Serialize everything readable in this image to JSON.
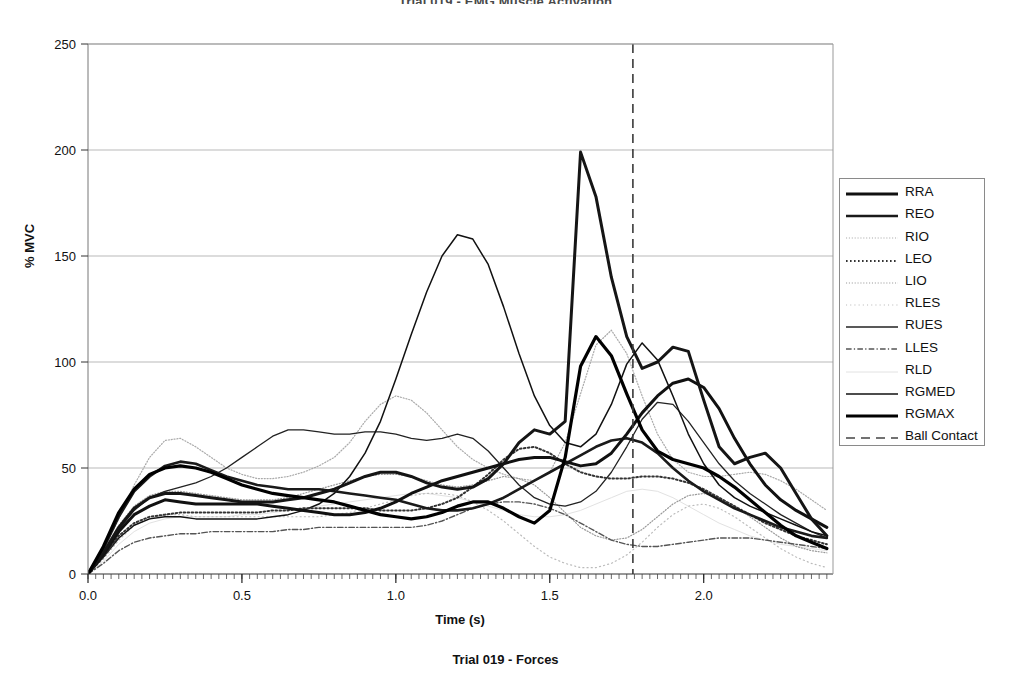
{
  "top_title": "Trial 019 - EMG Muscle Activation",
  "bottom_caption": "Trial 019 - Forces",
  "axes": {
    "ylabel": "% MVC",
    "xlabel": "Time (s)",
    "ytick_labels": [
      "0",
      "50",
      "100",
      "150",
      "200",
      "250"
    ],
    "xtick_labels": [
      "0.0",
      "0.5",
      "1.0",
      "1.5",
      "2.0"
    ]
  },
  "legend": {
    "items": [
      {
        "label": "RRA",
        "style": "thick-solid",
        "color": "#111111",
        "width": 3.0
      },
      {
        "label": "REO",
        "style": "thick-solid",
        "color": "#1a1a1a",
        "width": 2.6
      },
      {
        "label": "RIO",
        "style": "fine-dotted",
        "color": "#aaaaaa",
        "width": 1.2
      },
      {
        "label": "LEO",
        "style": "dotted-dark",
        "color": "#333333",
        "width": 2.0
      },
      {
        "label": "LIO",
        "style": "fine-dotted",
        "color": "#999999",
        "width": 1.2
      },
      {
        "label": "RLES",
        "style": "sparse-dotted",
        "color": "#bbbbbb",
        "width": 1.2
      },
      {
        "label": "RUES",
        "style": "thin-solid",
        "color": "#222222",
        "width": 1.3
      },
      {
        "label": "LLES",
        "style": "dash-dot",
        "color": "#555555",
        "width": 1.4
      },
      {
        "label": "RLD",
        "style": "faint",
        "color": "#e2e2e2",
        "width": 1.0
      },
      {
        "label": "RGMED",
        "style": "thin-solid",
        "color": "#111111",
        "width": 1.5
      },
      {
        "label": "RGMAX",
        "style": "thick-solid",
        "color": "#000000",
        "width": 3.2
      },
      {
        "label": "Ball Contact",
        "style": "dashed",
        "color": "#444444",
        "width": 1.6
      }
    ]
  },
  "chart_data": {
    "type": "line",
    "title": "Trial 019 - EMG Muscle Activation",
    "xlabel": "Time (s)",
    "ylabel": "% MVC",
    "xlim": [
      0.0,
      2.42
    ],
    "ylim": [
      0,
      250
    ],
    "xticks": [
      0.0,
      0.5,
      1.0,
      1.5,
      2.0
    ],
    "yticks": [
      0,
      50,
      100,
      150,
      200,
      250
    ],
    "grid": "horizontal",
    "legend_position": "right-outside",
    "annotations": [
      {
        "type": "vline",
        "name": "Ball Contact",
        "x": 1.77,
        "style": "dashed"
      }
    ],
    "x": [
      0.0,
      0.05,
      0.1,
      0.15,
      0.2,
      0.25,
      0.3,
      0.35,
      0.4,
      0.45,
      0.5,
      0.55,
      0.6,
      0.65,
      0.7,
      0.75,
      0.8,
      0.85,
      0.9,
      0.95,
      1.0,
      1.05,
      1.1,
      1.15,
      1.2,
      1.25,
      1.3,
      1.35,
      1.4,
      1.45,
      1.5,
      1.55,
      1.6,
      1.65,
      1.7,
      1.75,
      1.8,
      1.85,
      1.9,
      1.95,
      2.0,
      2.05,
      2.1,
      2.15,
      2.2,
      2.25,
      2.3,
      2.35,
      2.4
    ],
    "series": [
      {
        "name": "RRA",
        "color": "#111111",
        "style": "thick-solid",
        "values": [
          0,
          9,
          20,
          28,
          32,
          35,
          34,
          33,
          33,
          33,
          33,
          33,
          32,
          31,
          30,
          29,
          28,
          28,
          29,
          31,
          34,
          38,
          41,
          44,
          46,
          48,
          50,
          52,
          54,
          55,
          55,
          53,
          51,
          52,
          57,
          66,
          76,
          84,
          90,
          92,
          88,
          78,
          64,
          52,
          42,
          35,
          30,
          26,
          22
        ]
      },
      {
        "name": "REO",
        "color": "#1a1a1a",
        "style": "thick-solid",
        "values": [
          0,
          12,
          27,
          39,
          46,
          51,
          53,
          52,
          49,
          46,
          44,
          42,
          41,
          40,
          40,
          40,
          39,
          38,
          37,
          36,
          35,
          33,
          31,
          30,
          30,
          31,
          33,
          36,
          40,
          44,
          48,
          52,
          56,
          60,
          63,
          64,
          62,
          57,
          50,
          44,
          39,
          35,
          31,
          28,
          25,
          22,
          20,
          18,
          17
        ]
      },
      {
        "name": "RIO",
        "color": "#aaaaaa",
        "style": "fine-dotted",
        "values": [
          0,
          11,
          26,
          42,
          55,
          63,
          64,
          60,
          55,
          50,
          47,
          45,
          45,
          46,
          48,
          51,
          55,
          62,
          72,
          80,
          84,
          82,
          76,
          68,
          60,
          54,
          50,
          47,
          45,
          44,
          48,
          62,
          85,
          108,
          115,
          104,
          84,
          66,
          54,
          48,
          46,
          46,
          47,
          48,
          47,
          44,
          40,
          35,
          30
        ]
      },
      {
        "name": "LEO",
        "color": "#333333",
        "style": "dotted-dark",
        "values": [
          0,
          8,
          18,
          24,
          27,
          28,
          29,
          29,
          29,
          29,
          29,
          29,
          30,
          30,
          31,
          31,
          31,
          31,
          31,
          30,
          30,
          30,
          31,
          33,
          36,
          41,
          47,
          54,
          59,
          60,
          57,
          52,
          48,
          46,
          45,
          45,
          46,
          46,
          45,
          43,
          40,
          36,
          32,
          28,
          24,
          21,
          18,
          16,
          14
        ]
      },
      {
        "name": "LIO",
        "color": "#999999",
        "style": "fine-dotted",
        "values": [
          0,
          10,
          23,
          32,
          37,
          39,
          39,
          38,
          37,
          36,
          35,
          35,
          35,
          36,
          38,
          40,
          42,
          44,
          46,
          47,
          47,
          46,
          44,
          42,
          41,
          42,
          44,
          46,
          45,
          42,
          36,
          29,
          22,
          18,
          16,
          17,
          21,
          27,
          33,
          37,
          38,
          36,
          32,
          27,
          22,
          17,
          13,
          11,
          10
        ]
      },
      {
        "name": "RLES",
        "color": "#bbbbbb",
        "style": "sparse-dotted",
        "values": [
          0,
          7,
          16,
          23,
          26,
          28,
          28,
          27,
          27,
          27,
          27,
          27,
          27,
          27,
          27,
          27,
          28,
          29,
          31,
          33,
          35,
          37,
          38,
          38,
          37,
          34,
          30,
          25,
          19,
          13,
          8,
          5,
          3,
          3,
          5,
          9,
          15,
          22,
          28,
          32,
          33,
          31,
          27,
          22,
          17,
          12,
          8,
          5,
          3
        ]
      },
      {
        "name": "RUES",
        "color": "#222222",
        "style": "thin-solid",
        "values": [
          0,
          9,
          21,
          30,
          36,
          39,
          41,
          43,
          46,
          50,
          55,
          60,
          65,
          68,
          68,
          67,
          66,
          66,
          67,
          67,
          66,
          64,
          63,
          64,
          66,
          64,
          58,
          50,
          42,
          36,
          33,
          32,
          34,
          39,
          48,
          60,
          73,
          81,
          80,
          72,
          62,
          52,
          44,
          38,
          33,
          28,
          24,
          20,
          17
        ]
      },
      {
        "name": "LLES",
        "color": "#555555",
        "style": "dash-dot",
        "values": [
          0,
          5,
          11,
          15,
          17,
          18,
          19,
          19,
          20,
          20,
          20,
          20,
          20,
          21,
          21,
          22,
          22,
          22,
          22,
          22,
          22,
          22,
          23,
          25,
          28,
          31,
          33,
          34,
          34,
          33,
          31,
          28,
          24,
          20,
          16,
          14,
          13,
          13,
          14,
          15,
          16,
          17,
          17,
          17,
          16,
          15,
          14,
          13,
          12
        ]
      },
      {
        "name": "RLD",
        "color": "#e2e2e2",
        "style": "faint",
        "values": [
          0,
          6,
          14,
          20,
          24,
          26,
          27,
          27,
          27,
          27,
          28,
          28,
          29,
          30,
          31,
          32,
          33,
          34,
          35,
          36,
          37,
          38,
          38,
          37,
          36,
          34,
          32,
          30,
          28,
          27,
          27,
          28,
          30,
          33,
          36,
          39,
          40,
          39,
          36,
          32,
          28,
          24,
          21,
          18,
          16,
          14,
          13,
          12,
          11
        ]
      },
      {
        "name": "RGMED",
        "color": "#111111",
        "style": "thin-solid",
        "values": [
          0,
          8,
          17,
          23,
          26,
          27,
          27,
          26,
          26,
          26,
          26,
          26,
          27,
          28,
          30,
          33,
          38,
          46,
          57,
          72,
          92,
          113,
          133,
          150,
          160,
          158,
          146,
          126,
          104,
          84,
          70,
          62,
          60,
          66,
          80,
          99,
          109,
          101,
          84,
          66,
          52,
          42,
          36,
          32,
          29,
          26,
          23,
          20,
          18
        ]
      },
      {
        "name": "RGMAX",
        "color": "#000000",
        "style": "thick-solid",
        "values": [
          0,
          13,
          29,
          40,
          47,
          50,
          51,
          50,
          48,
          45,
          42,
          40,
          38,
          37,
          36,
          35,
          34,
          32,
          30,
          28,
          27,
          26,
          27,
          29,
          32,
          34,
          34,
          31,
          27,
          24,
          30,
          55,
          98,
          112,
          103,
          85,
          68,
          58,
          54,
          52,
          50,
          46,
          41,
          35,
          29,
          23,
          18,
          15,
          12
        ]
      },
      {
        "name": "RRA-peak",
        "color": "#151515",
        "style": "thick-solid",
        "values": [
          0,
          10,
          22,
          31,
          36,
          38,
          38,
          37,
          36,
          35,
          34,
          34,
          34,
          35,
          36,
          38,
          40,
          43,
          46,
          48,
          48,
          46,
          43,
          41,
          40,
          41,
          45,
          52,
          62,
          68,
          66,
          72,
          199,
          178,
          140,
          112,
          97,
          100,
          107,
          105,
          82,
          60,
          52,
          55,
          57,
          50,
          38,
          26,
          18
        ]
      }
    ]
  }
}
